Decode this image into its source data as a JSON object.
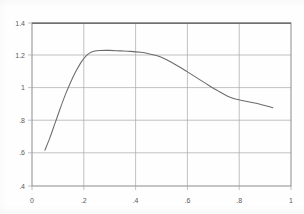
{
  "figure": {
    "background_color": "#fefefe",
    "line_color": "#6b6b6b",
    "grid_color": "#a8a8a8",
    "axis_color": "#8c8c8c",
    "label_color": "#5a5a5a"
  },
  "chart_data": {
    "type": "line",
    "title": "",
    "subtitle": "",
    "xlabel": "",
    "ylabel": "",
    "xlim": [
      0,
      1
    ],
    "ylim": [
      0.4,
      1.4
    ],
    "grid": true,
    "legend": false,
    "legend_position": "none",
    "x_ticks": [
      0,
      0.2,
      0.4,
      0.6,
      0.8,
      1
    ],
    "x_tick_labels": [
      "0",
      ".2",
      ".4",
      ".6",
      ".8",
      "1"
    ],
    "y_ticks": [
      0.4,
      0.6,
      0.8,
      1,
      1.2,
      1.4
    ],
    "y_tick_labels": [
      ".4",
      ".6",
      ".8",
      "1",
      "1.2",
      "1.4"
    ],
    "series": [
      {
        "name": "curve",
        "x": [
          0.05,
          0.07,
          0.09,
          0.11,
          0.13,
          0.15,
          0.17,
          0.19,
          0.21,
          0.23,
          0.26,
          0.3,
          0.34,
          0.38,
          0.42,
          0.45,
          0.48,
          0.51,
          0.54,
          0.57,
          0.6,
          0.64,
          0.68,
          0.72,
          0.76,
          0.79,
          0.82,
          0.85,
          0.88,
          0.93
        ],
        "y": [
          0.62,
          0.7,
          0.79,
          0.88,
          0.965,
          1.04,
          1.105,
          1.16,
          1.2,
          1.222,
          1.231,
          1.232,
          1.229,
          1.226,
          1.22,
          1.212,
          1.2,
          1.182,
          1.158,
          1.13,
          1.1,
          1.06,
          1.02,
          0.982,
          0.948,
          0.932,
          0.922,
          0.912,
          0.902,
          0.88
        ]
      }
    ],
    "annotations": []
  }
}
